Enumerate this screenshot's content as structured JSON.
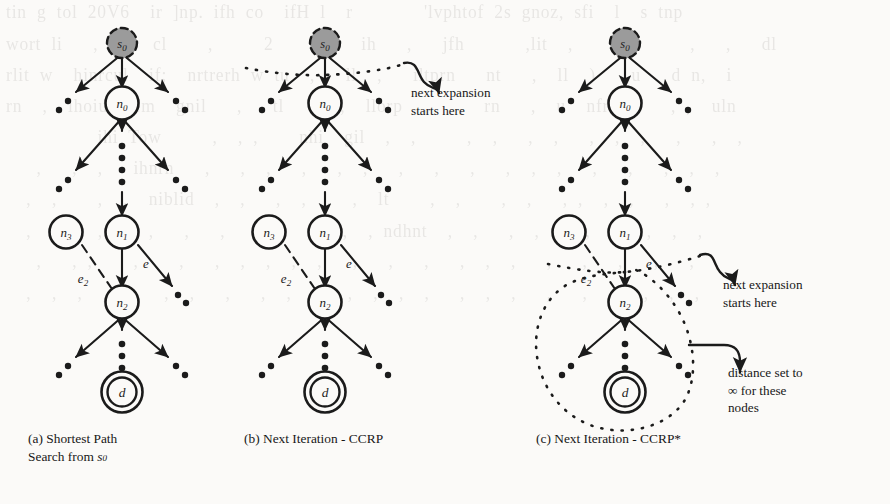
{
  "figure": {
    "kind": "diagram",
    "panels": [
      {
        "id": "a",
        "caption_label": "(a)",
        "caption_text": "Shortest Path Search from s0",
        "caption_lines": [
          "(a)   Shortest   Path",
          "Search from s0"
        ],
        "nodes": [
          {
            "name": "s0",
            "label": "s0",
            "style": "source-dashed-filled"
          },
          {
            "name": "n0",
            "label": "n0",
            "style": "circle"
          },
          {
            "name": "n1",
            "label": "n1",
            "style": "circle"
          },
          {
            "name": "n2",
            "label": "n2",
            "style": "circle"
          },
          {
            "name": "n3",
            "label": "n3",
            "style": "circle-detached"
          },
          {
            "name": "d",
            "label": "d",
            "style": "double-circle-target"
          }
        ],
        "edges": [
          {
            "from": "n1",
            "to": "n2",
            "label": "e",
            "style": "solid"
          },
          {
            "from": "n3",
            "to": "n2",
            "label": "e2",
            "style": "dashed"
          }
        ],
        "overlays": []
      },
      {
        "id": "b",
        "caption_label": "(b)",
        "caption_text": "Next Iteration - CCRP",
        "caption_lines": [
          "(b) Next Iteration - CCRP"
        ],
        "nodes": [
          {
            "name": "s0",
            "label": "s0",
            "style": "source-dashed-filled"
          },
          {
            "name": "n0",
            "label": "n0",
            "style": "circle"
          },
          {
            "name": "n1",
            "label": "n1",
            "style": "circle"
          },
          {
            "name": "n2",
            "label": "n2",
            "style": "circle"
          },
          {
            "name": "n3",
            "label": "n3",
            "style": "circle-detached"
          },
          {
            "name": "d",
            "label": "d",
            "style": "double-circle-target"
          }
        ],
        "edges": [
          {
            "from": "n1",
            "to": "n2",
            "label": "e",
            "style": "solid"
          },
          {
            "from": "n3",
            "to": "n2",
            "label": "e2",
            "style": "dashed"
          }
        ],
        "overlays": [
          {
            "type": "dotted-cut-line",
            "at": "below s0"
          },
          {
            "type": "curved-arrow-annotation",
            "text_lines": [
              "next expansion",
              "starts here"
            ]
          }
        ]
      },
      {
        "id": "c",
        "caption_label": "(c)",
        "caption_text": "Next Iteration - CCRP*",
        "caption_lines": [
          "(c) Next Iteration - CCRP*"
        ],
        "nodes": [
          {
            "name": "s0",
            "label": "s0",
            "style": "source-dashed-filled"
          },
          {
            "name": "n0",
            "label": "n0",
            "style": "circle"
          },
          {
            "name": "n1",
            "label": "n1",
            "style": "circle"
          },
          {
            "name": "n2",
            "label": "n2",
            "style": "circle"
          },
          {
            "name": "n3",
            "label": "n3",
            "style": "circle-detached"
          },
          {
            "name": "d",
            "label": "d",
            "style": "double-circle-target"
          }
        ],
        "edges": [
          {
            "from": "n1",
            "to": "n2",
            "label": "e",
            "style": "solid"
          },
          {
            "from": "n3",
            "to": "n2",
            "label": "e2",
            "style": "dashed"
          }
        ],
        "overlays": [
          {
            "type": "dotted-cut-line",
            "at": "above n2"
          },
          {
            "type": "dotted-loop",
            "at": "subtree below n2"
          },
          {
            "type": "curved-arrow-annotation",
            "text_lines": [
              "next expansion",
              "starts here"
            ]
          },
          {
            "type": "curved-arrow-annotation",
            "text_lines": [
              "distance set to",
              "∞  for  these",
              "nodes"
            ]
          }
        ]
      }
    ],
    "annotations": {
      "next_expansion_b": {
        "line1": "next expansion",
        "line2": "starts here"
      },
      "next_expansion_c": {
        "line1": "next expansion",
        "line2": "starts here"
      },
      "distance_inf": {
        "line1": "distance set to",
        "line2": "∞   for   these",
        "line3": "nodes"
      }
    },
    "node_labels": {
      "s0_base": "s",
      "s0_sub": "0",
      "n0_base": "n",
      "n0_sub": "0",
      "n1_base": "n",
      "n1_sub": "1",
      "n2_base": "n",
      "n2_sub": "2",
      "n3_base": "n",
      "n3_sub": "3",
      "d": "d",
      "e": "e",
      "e2_base": "e",
      "e2_sub": "2"
    },
    "captions": {
      "a_label": "(a)",
      "a_line1": "Shortest     Path",
      "a_line2_pre": "Search from ",
      "a_line2_sym": "s",
      "a_line2_sub": "0",
      "b_full": "(b) Next Iteration - CCRP",
      "c_full": "(c) Next Iteration - CCRP*"
    },
    "colors": {
      "ink": "#1b1b1b",
      "paper": "#fbfaf8",
      "source_fill": "#9b9b9b",
      "ghost": "#8d8a86"
    },
    "ghost_text": "tin g tol 20V6  ir ]np. ifh co  ifH l  r       'lvphtof 2s gnoz, sfi  l  s tnp\nwort li   , nm  cl    ,     2    , ll  ih   ,   jfh      ,lit  ,      ,     ,   ,   dl\nrlit w  hinrcul  if;  nrtrerh w tu  ,   ll  ,   iltprn   nt   ,  ll  )   ,u   d n,  i\nrn  ,  ihoiuldnem  gnil   ,   tl   ,  ,  llorp  ,   ,  rn   ,  u  nfrl  ,   , ,  uln\n         ihi Tow     ,  , ,    nhi  gil  ,  ,     ,  ,   ,  ,   ,  ,  ,   ,   ,  ,\n   ,   ,  ,   ihnrn   ,   ,  ,   ,   ,  ,   ,   ,   ,   ,  ,  ,   ,   ,   ,  ,  ,\n  ,  ,    ,  ,  niblid  ,  ,   ,  ,  ,  ,  lt    ,  ,    ,  ,   , ,  ,  ,   ,  , ,\n  ,  ,    ,  ,  ,   ,   ,   ,  ,  ,   ,  , ndhnt  ,  ,   ,  ,  ,  ,   ,  ,  ,  ,\n   ,   , ,    ,    ,   ,  ,  ,  ,  ,   ,   ,   ,   ,  ,  ,   ,   ,   ,   ,   ,  ,\n  ,  ,  ,  ,  ,   ,  ,   ,   ,  ,  ,   ,  ,  ,  ,   ,  ,  ,   ,   ,  ,   ,  ,  ,"
  }
}
